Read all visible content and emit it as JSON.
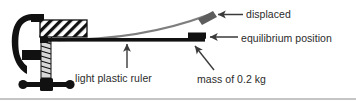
{
  "diagram": {
    "type": "physics-apparatus-diagram",
    "background_color": "#ffffff",
    "labels": {
      "displaced": "displaced",
      "equilibrium_position": "equilibrium position",
      "light_plastic_ruler": "light plastic ruler",
      "mass": "mass of 0.2 kg"
    },
    "values": {
      "mass_value": "0.2",
      "mass_unit": "kg"
    },
    "colors": {
      "ink": "#1a1a1a",
      "text": "#2b2b2b",
      "displaced_ruler": "#7a7a7a",
      "displaced_mass": "#5a5a5a",
      "arrow": "#3a3a3a",
      "clamp": "#111111",
      "screw_shade": "#b5b5b5"
    },
    "parts": {
      "g_clamp": "g-clamp",
      "clamped_block": "hatched-block",
      "ruler": "ruler-beam",
      "mass_block": "mass-block",
      "displaced_ruler": "displaced-ruler-curve"
    }
  }
}
